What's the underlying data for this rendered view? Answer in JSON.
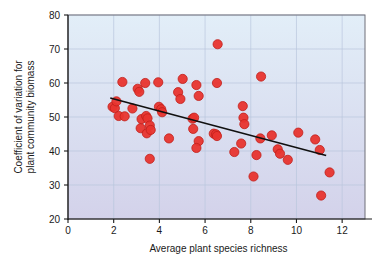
{
  "chart_data": {
    "type": "scatter",
    "title": "",
    "xlabel": "Average plant species richness",
    "ylabel": "Coefficient of variation for plant community biomass",
    "ylabel_lines": [
      "Coefficient of variation for",
      "plant community biomass"
    ],
    "xlim": [
      0,
      13
    ],
    "ylim": [
      20,
      80
    ],
    "xticks": [
      0,
      2,
      4,
      6,
      8,
      10,
      12
    ],
    "xtick_labels": [
      "0",
      "2",
      "4",
      "6",
      "8",
      "10",
      "12"
    ],
    "yticks": [
      20,
      30,
      40,
      50,
      60,
      70,
      80
    ],
    "ytick_labels": [
      "20",
      "30",
      "40",
      "50",
      "60",
      "70",
      "80"
    ],
    "grid": true,
    "grid_color": "#b9c6dd",
    "legend": "none",
    "marker_color": "#e8342e",
    "marker_edge_color": "#c01f1a",
    "marker_size": 4.6,
    "plot_bg_top": "#e2eef8",
    "plot_bg_bottom": "#d3d2ea",
    "frame_color": "#6f6f78",
    "axis_color": "#1a1a1a",
    "trendline": {
      "color": "#101010",
      "x_start": 1.85,
      "y_start": 55.6,
      "x_end": 11.3,
      "y_end": 38.7
    },
    "points": [
      {
        "x": 1.95,
        "y": 53.0
      },
      {
        "x": 2.05,
        "y": 52.6
      },
      {
        "x": 2.12,
        "y": 54.6
      },
      {
        "x": 2.22,
        "y": 50.3
      },
      {
        "x": 2.38,
        "y": 60.3
      },
      {
        "x": 2.48,
        "y": 50.2
      },
      {
        "x": 2.82,
        "y": 52.5
      },
      {
        "x": 3.05,
        "y": 58.3
      },
      {
        "x": 3.12,
        "y": 57.4
      },
      {
        "x": 3.18,
        "y": 46.7
      },
      {
        "x": 3.22,
        "y": 49.4
      },
      {
        "x": 3.38,
        "y": 60.0
      },
      {
        "x": 3.42,
        "y": 50.3
      },
      {
        "x": 3.48,
        "y": 49.6
      },
      {
        "x": 3.45,
        "y": 45.2
      },
      {
        "x": 3.58,
        "y": 47.5
      },
      {
        "x": 3.62,
        "y": 46.2
      },
      {
        "x": 3.58,
        "y": 37.7
      },
      {
        "x": 3.95,
        "y": 60.2
      },
      {
        "x": 3.98,
        "y": 53.0
      },
      {
        "x": 4.08,
        "y": 52.3
      },
      {
        "x": 4.12,
        "y": 51.4
      },
      {
        "x": 4.42,
        "y": 43.7
      },
      {
        "x": 4.82,
        "y": 57.3
      },
      {
        "x": 4.92,
        "y": 55.3
      },
      {
        "x": 5.02,
        "y": 61.2
      },
      {
        "x": 5.45,
        "y": 49.5
      },
      {
        "x": 5.52,
        "y": 49.8
      },
      {
        "x": 5.48,
        "y": 46.5
      },
      {
        "x": 5.62,
        "y": 59.4
      },
      {
        "x": 5.72,
        "y": 56.2
      },
      {
        "x": 5.72,
        "y": 42.9
      },
      {
        "x": 5.62,
        "y": 40.9
      },
      {
        "x": 6.38,
        "y": 45.1
      },
      {
        "x": 6.48,
        "y": 44.9
      },
      {
        "x": 6.52,
        "y": 44.4
      },
      {
        "x": 6.52,
        "y": 60.0
      },
      {
        "x": 6.55,
        "y": 71.4
      },
      {
        "x": 7.28,
        "y": 39.7
      },
      {
        "x": 7.58,
        "y": 42.2
      },
      {
        "x": 7.65,
        "y": 53.2
      },
      {
        "x": 7.68,
        "y": 49.8
      },
      {
        "x": 7.72,
        "y": 47.9
      },
      {
        "x": 8.12,
        "y": 32.5
      },
      {
        "x": 8.25,
        "y": 38.8
      },
      {
        "x": 8.42,
        "y": 43.7
      },
      {
        "x": 8.45,
        "y": 61.9
      },
      {
        "x": 8.92,
        "y": 44.6
      },
      {
        "x": 9.18,
        "y": 40.5
      },
      {
        "x": 9.28,
        "y": 39.2
      },
      {
        "x": 9.62,
        "y": 37.4
      },
      {
        "x": 10.08,
        "y": 45.4
      },
      {
        "x": 10.82,
        "y": 43.4
      },
      {
        "x": 11.02,
        "y": 40.3
      },
      {
        "x": 11.08,
        "y": 26.9
      },
      {
        "x": 11.45,
        "y": 33.7
      }
    ]
  }
}
